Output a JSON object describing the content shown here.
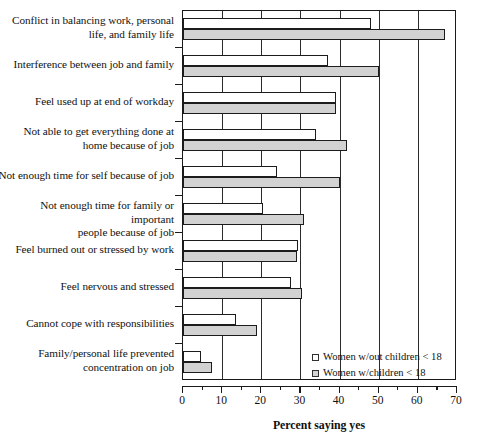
{
  "chart_data": {
    "type": "bar",
    "orientation": "horizontal",
    "title": "",
    "xlabel": "Percent saying yes",
    "ylabel": "",
    "xlim": [
      0,
      70
    ],
    "xticks": [
      0,
      10,
      20,
      30,
      40,
      50,
      60,
      70
    ],
    "xtick_labels": [
      "0",
      "10",
      "20",
      "30",
      "40",
      "50",
      "60",
      "70"
    ],
    "minor_tick_step": 5,
    "grid": true,
    "legend_position": "inside-lower-right",
    "categories": [
      "Conflict in balancing work, personal life, and family life",
      "Interference between job and family",
      "Feel used up at end of workday",
      "Not able to get everything done at home because of job",
      "Not enough time for self because of job",
      "Not enough time for family or important people because of job",
      "Feel burned out or stressed by work",
      "Feel nervous and stressed",
      "Cannot cope with responsibilities",
      "Family/personal life prevented concentration on job"
    ],
    "category_lines": [
      [
        "Conflict in balancing work, personal",
        "life, and family life"
      ],
      [
        "Interference between job and family"
      ],
      [
        "Feel used up at end of workday"
      ],
      [
        "Not able to get everything done at",
        "home because of job"
      ],
      [
        "Not enough time for self because of job"
      ],
      [
        "Not enough time for family or important",
        "people because of job"
      ],
      [
        "Feel burned out or stressed by work"
      ],
      [
        "Feel nervous and stressed"
      ],
      [
        "Cannot cope with responsibilities"
      ],
      [
        "Family/personal life prevented",
        "concentration on job"
      ]
    ],
    "series": [
      {
        "name": "Women w/out children < 18",
        "color": "#ffffff",
        "values": [
          48,
          37,
          39,
          34,
          24,
          20.5,
          29.5,
          27.5,
          13.5,
          4.5
        ]
      },
      {
        "name": "Women w/children < 18",
        "color": "#d2d2d2",
        "values": [
          67,
          50,
          39,
          42,
          40,
          31,
          29,
          30.5,
          19,
          7.5
        ]
      }
    ]
  },
  "legend": {
    "items": [
      {
        "label": "Women w/out children < 18",
        "swatch": "nokids"
      },
      {
        "label": "Women w/children < 18",
        "swatch": "kids"
      }
    ]
  },
  "axis": {
    "x_title": "Percent saying yes"
  }
}
